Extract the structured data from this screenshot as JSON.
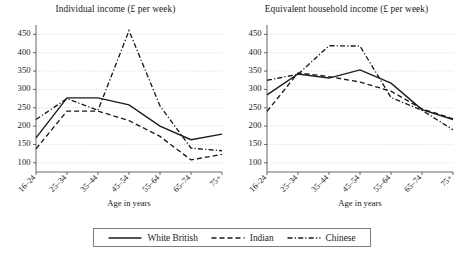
{
  "chart_data": [
    {
      "type": "line",
      "panel": "left",
      "title": "Individual income (£ per week)",
      "xlabel": "Age in years",
      "ylabel": "",
      "categories": [
        "16–24",
        "25–34",
        "35–44",
        "45–54",
        "55–64",
        "65–74",
        "75+"
      ],
      "ylim": [
        75,
        470
      ],
      "yticks": [
        100,
        150,
        200,
        250,
        300,
        350,
        400,
        450
      ],
      "grid": true,
      "series": [
        {
          "name": "White British",
          "style": "solid",
          "values": [
            168,
            277,
            277,
            258,
            200,
            163,
            178
          ]
        },
        {
          "name": "Indian",
          "style": "dashed",
          "values": [
            138,
            241,
            241,
            215,
            172,
            108,
            123
          ]
        },
        {
          "name": "Chinese",
          "style": "dashdot",
          "values": [
            218,
            275,
            243,
            460,
            255,
            140,
            133
          ]
        }
      ]
    },
    {
      "type": "line",
      "panel": "right",
      "title": "Equivalent household income (£ per week)",
      "xlabel": "Age in years",
      "ylabel": "",
      "categories": [
        "16–24",
        "25–34",
        "35–44",
        "45–54",
        "55–64",
        "65–74",
        "75+"
      ],
      "ylim": [
        75,
        470
      ],
      "yticks": [
        100,
        150,
        200,
        250,
        300,
        350,
        400,
        450
      ],
      "grid": true,
      "series": [
        {
          "name": "White British",
          "style": "solid",
          "values": [
            285,
            342,
            331,
            353,
            317,
            245,
            218
          ]
        },
        {
          "name": "Indian",
          "style": "dashed",
          "values": [
            240,
            345,
            335,
            320,
            295,
            247,
            220
          ]
        },
        {
          "name": "Chinese",
          "style": "dashdot",
          "values": [
            325,
            341,
            419,
            418,
            278,
            243,
            190
          ]
        }
      ]
    }
  ],
  "legend": {
    "position": "bottom-center",
    "entries": [
      {
        "label": "White British",
        "style": "solid"
      },
      {
        "label": "Indian",
        "style": "dashed"
      },
      {
        "label": "Chinese",
        "style": "dashdot"
      }
    ]
  }
}
